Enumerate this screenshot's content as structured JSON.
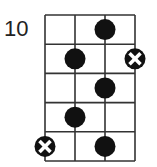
{
  "diagram": {
    "type": "fretboard-scale-diagram",
    "start_fret_label": "10",
    "strings": 4,
    "frets": 5,
    "grid": {
      "left": 45,
      "top": 15,
      "col_spacing": 30,
      "row_spacing": 29.2
    },
    "colors": {
      "line": "#333333",
      "dot": "#111111",
      "x_mark": "#ffffff",
      "background": "#ffffff"
    },
    "markers": [
      {
        "fret": 1,
        "string": 3,
        "kind": "dot"
      },
      {
        "fret": 2,
        "string": 2,
        "kind": "dot"
      },
      {
        "fret": 2,
        "string": 4,
        "kind": "root-x"
      },
      {
        "fret": 3,
        "string": 3,
        "kind": "dot"
      },
      {
        "fret": 4,
        "string": 2,
        "kind": "dot"
      },
      {
        "fret": 5,
        "string": 1,
        "kind": "root-x"
      },
      {
        "fret": 5,
        "string": 3,
        "kind": "dot"
      }
    ]
  }
}
